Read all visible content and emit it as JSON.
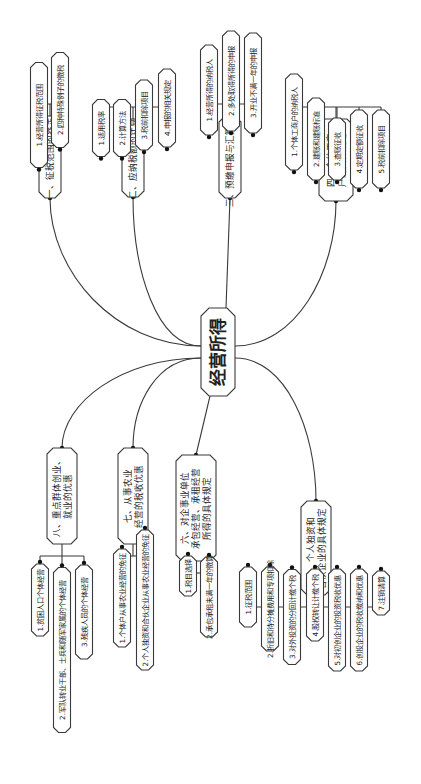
{
  "root": {
    "label": "经营所得"
  },
  "branches": [
    {
      "id": "b1",
      "label_lines": [
        "一、征税范围的界定"
      ],
      "children": [
        "1.经营所得征税范围",
        "2.四种特殊例子的徵税"
      ]
    },
    {
      "id": "b2",
      "label_lines": [
        "二、应纳税额的计算"
      ],
      "children": [
        "1.适用税率",
        "2.计算方法",
        "3.税前扣除项目",
        "4.申报的相关规定"
      ]
    },
    {
      "id": "b3",
      "label_lines": [
        "三、预缴申报与汇算清缴"
      ],
      "children": [
        "1.经营所得的纳税人",
        "2.多处取得所得的申报",
        "3.开业不满一年的申报"
      ]
    },
    {
      "id": "b4",
      "label_lines": [
        "四、个体工商",
        "户的具体规定"
      ],
      "children": [
        "1.个体工商户的纳税人",
        "2.建账和建账标准",
        "3.查账征收",
        "4.定期定额征收",
        "5.税前扣除项目"
      ]
    },
    {
      "id": "b5",
      "label_lines": [
        "五、个人独资和",
        "合伙企业的具体规定"
      ],
      "children": [
        "1.征税范围",
        "2.折旧和待分摊费用和专项扣除",
        "3.对外投资的分回计缴个税",
        "4.股权转让计缴个税",
        "5.对初创企业的投资税收优惠",
        "6.创投企业的税收缴纳和优惠",
        "7.注销清算"
      ]
    },
    {
      "id": "b6",
      "label_lines": [
        "六、对企事业单位",
        "承包经营、承租经营",
        "所得的具体规定"
      ],
      "children": [
        "1.税目选择",
        "2.承包承租未满一年的徵算"
      ]
    },
    {
      "id": "b7",
      "label_lines": [
        "七、从事农业",
        "经营的税收优惠"
      ],
      "children": [
        "1.个体户从事农业经营的免征",
        "2.个人独资和合伙企业从事农业经营的免征"
      ]
    },
    {
      "id": "b8",
      "label_lines": [
        "八、重点群体创业、",
        "就业的优惠"
      ],
      "children": [
        "1.贫困人口个体经营",
        "2.军队转业干部、士兵和随军家属的个体经营",
        "3.残疾人员的个体经营"
      ]
    }
  ],
  "colors": {
    "line": "#3a3a3a",
    "text": "#222222",
    "background": "#ffffff"
  }
}
